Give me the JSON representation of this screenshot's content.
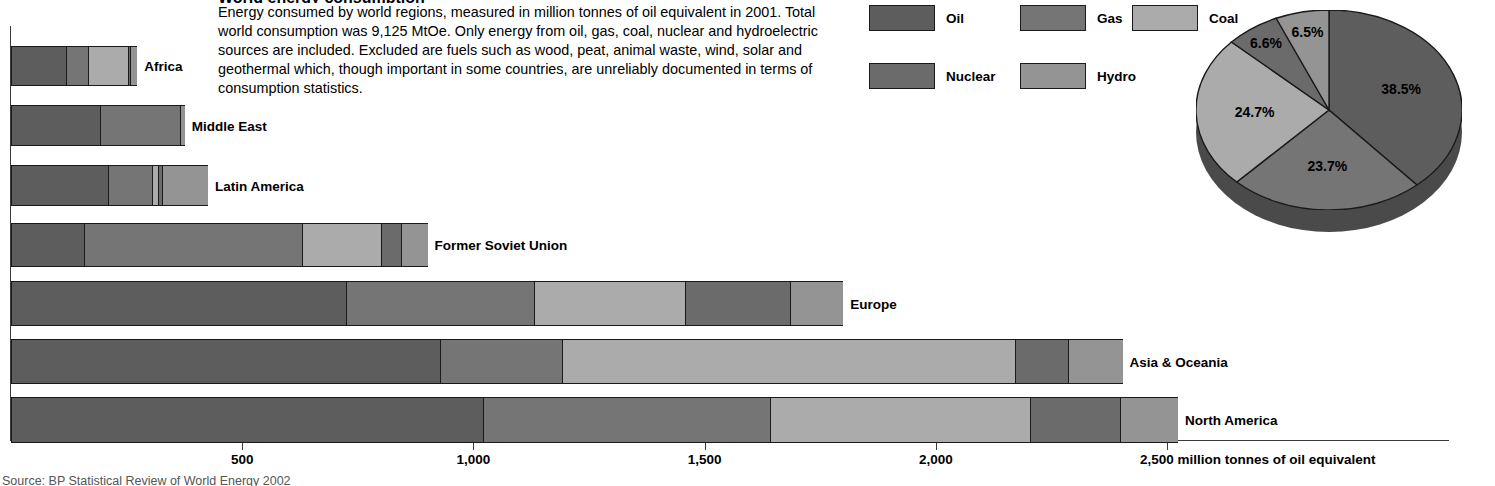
{
  "header": {
    "title": "World energy consumption",
    "description": "Energy consumed by world regions, measured in million tonnes of oil equivalent in 2001. Total world consumption was 9,125 MtOe. Only energy from oil, gas, coal, nuclear and hydroelectric sources are included. Excluded are fuels such as wood, peat, animal waste, wind, solar and geothermal which, though important in some countries, are unreliably documented in terms of consumption statistics."
  },
  "source": "Source: BP Statistical Review of World Energy 2002",
  "legend": {
    "items": [
      {
        "label": "Oil",
        "color": "#5d5d5d"
      },
      {
        "label": "Gas",
        "color": "#757575"
      },
      {
        "label": "Coal",
        "color": "#ababab"
      },
      {
        "label": "Nuclear",
        "color": "#6b6b6b"
      },
      {
        "label": "Hydro",
        "color": "#949494"
      }
    ]
  },
  "chart_data": [
    {
      "type": "bar",
      "orientation": "horizontal",
      "stacked": true,
      "title": "World energy consumption",
      "xlabel": "2,500 million tonnes of oil equivalent",
      "ylabel": "",
      "unit": "million tonnes of oil equivalent",
      "xlim": [
        0,
        2600
      ],
      "xticks": [
        500,
        1000,
        1500,
        2000,
        2500
      ],
      "xtick_labels": [
        "500",
        "1,000",
        "1,500",
        "2,000",
        "2,500"
      ],
      "unit_label": "million tonnes of oil equivalent",
      "grid": false,
      "legend_position": "top-right",
      "categories": [
        "Africa",
        "Middle East",
        "Latin America",
        "Former Soviet Union",
        "Europe",
        "Asia & Oceania",
        "North America"
      ],
      "series": [
        {
          "name": "Oil",
          "color": "#5d5d5d",
          "values": [
            119,
            192,
            210,
            158,
            725,
            928,
            1021
          ]
        },
        {
          "name": "Gas",
          "color": "#757575",
          "values": [
            48,
            173,
            95,
            471,
            406,
            264,
            621
          ]
        },
        {
          "name": "Coal",
          "color": "#ababab",
          "values": [
            86,
            0,
            13,
            171,
            327,
            980,
            562
          ]
        },
        {
          "name": "Nuclear",
          "color": "#6b6b6b",
          "values": [
            4,
            0,
            9,
            43,
            227,
            115,
            195
          ]
        },
        {
          "name": "Hydro",
          "color": "#949494",
          "values": [
            16,
            11,
            99,
            58,
            115,
            117,
            125
          ]
        }
      ],
      "totals": [
        273,
        376,
        426,
        901,
        1800,
        2404,
        2524
      ]
    },
    {
      "type": "pie",
      "title": "Share of world energy consumption by fuel",
      "three_d": true,
      "labels": [
        "Oil",
        "Gas",
        "Coal",
        "Nuclear",
        "Hydro"
      ],
      "values": [
        38.5,
        23.7,
        24.7,
        6.6,
        6.5
      ],
      "value_labels": [
        "38.5%",
        "23.7%",
        "24.7%",
        "6.6%",
        "6.5%"
      ],
      "colors": [
        "#5d5d5d",
        "#757575",
        "#ababab",
        "#6b6b6b",
        "#949494"
      ],
      "legend_position": "top-left"
    }
  ]
}
